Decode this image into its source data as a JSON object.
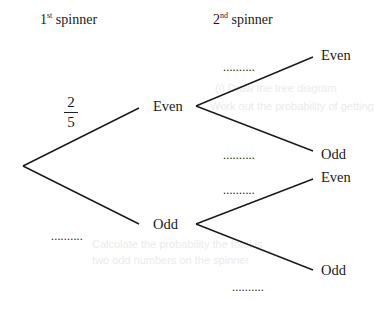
{
  "headers": {
    "first": "1st spinner",
    "first_num": "1",
    "first_sup": "st",
    "first_rest": " spinner",
    "second_num": "2",
    "second_sup": "nd",
    "second_rest": " spinner"
  },
  "first_spinner": {
    "even": {
      "label": "Even",
      "probability": {
        "numerator": "2",
        "denominator": "5"
      }
    },
    "odd": {
      "label": "Odd",
      "probability": ".........."
    }
  },
  "second_spinner": {
    "after_even": {
      "even": {
        "label": "Even",
        "probability": ".........."
      },
      "odd": {
        "label": "Odd",
        "probability": ".........."
      }
    },
    "after_odd": {
      "even": {
        "label": "Even",
        "probability": ".........."
      },
      "odd": {
        "label": "Odd",
        "probability": ".........."
      }
    }
  },
  "ghost_text": [
    "(i) Draw the tree diagram",
    "Work out the probability of getting",
    "Calculate the probability the total is",
    "two odd numbers on the spinner"
  ]
}
